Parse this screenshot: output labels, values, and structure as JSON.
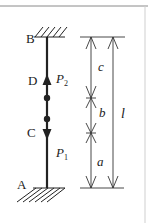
{
  "figure": {
    "points": {
      "A": "A",
      "B": "B",
      "C": "C",
      "D": "D"
    },
    "forces": {
      "P1": {
        "symbol": "P",
        "subscript": "1",
        "direction": "down",
        "at": "C"
      },
      "P2": {
        "symbol": "P",
        "subscript": "2",
        "direction": "up",
        "at": "D"
      }
    },
    "dimensions": {
      "a": "a",
      "b": "b",
      "c": "c",
      "l": "l"
    },
    "supports": [
      "fixed-top-B",
      "fixed-bottom-A"
    ],
    "colors": {
      "ink": "#222222",
      "border": "#9a9a9a"
    }
  }
}
